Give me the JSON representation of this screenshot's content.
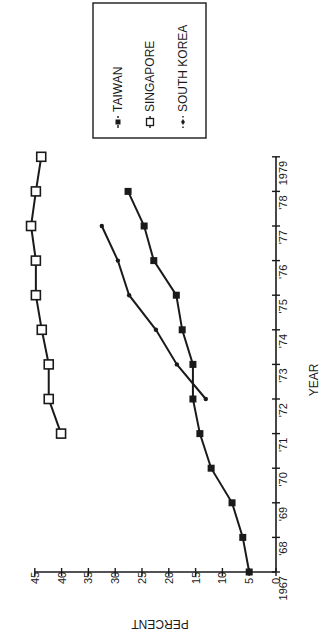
{
  "chart_data": {
    "type": "line",
    "orientation": "rotated 90 degrees counterclockwise",
    "title": "",
    "xlabel": "YEAR",
    "ylabel": "PERCENT",
    "x_tick_labels": [
      "1967",
      "'68",
      "'69",
      "'70",
      "'71",
      "'72",
      "'73",
      "'74",
      "'75",
      "'76",
      "'77",
      "'78",
      "1979"
    ],
    "x_ticks": [
      1967,
      1968,
      1969,
      1970,
      1971,
      1972,
      1973,
      1974,
      1975,
      1976,
      1977,
      1978,
      1979
    ],
    "y_ticks": [
      0,
      5,
      10,
      15,
      20,
      25,
      30,
      35,
      40,
      45
    ],
    "xlim": [
      1967,
      1979
    ],
    "ylim": [
      0,
      45
    ],
    "grid": false,
    "legend_position": "upper right (in rotated view)",
    "series": [
      {
        "name": "TAIWAN",
        "marker": "filled-square",
        "x": [
          1967,
          1968,
          1969,
          1970,
          1971,
          1972,
          1973,
          1974,
          1975,
          1976,
          1977,
          1978
        ],
        "values": [
          5.0,
          6.2,
          8.2,
          12.1,
          14.2,
          15.5,
          15.5,
          17.5,
          18.6,
          22.8,
          24.6,
          27.6
        ]
      },
      {
        "name": "SINGAPORE",
        "marker": "open-square",
        "x": [
          1971,
          1972,
          1973,
          1974,
          1975,
          1976,
          1977,
          1978,
          1979
        ],
        "values": [
          40.1,
          42.4,
          42.4,
          43.7,
          44.8,
          44.8,
          45.7,
          44.8,
          43.8
        ]
      },
      {
        "name": "SOUTH KOREA",
        "marker": "dot",
        "x": [
          1972,
          1973,
          1974,
          1975,
          1976,
          1977
        ],
        "values": [
          13.1,
          18.5,
          22.4,
          27.4,
          29.5,
          32.5
        ]
      }
    ]
  },
  "legend": {
    "items": [
      {
        "label": "TAIWAN",
        "symbol": "-■-"
      },
      {
        "label": "SINGAPORE",
        "symbol": "-□-"
      },
      {
        "label": "SOUTH KOREA",
        "symbol": "·•·"
      }
    ]
  },
  "colors": {
    "ink": "#1a1a1a",
    "background": "#ffffff"
  }
}
